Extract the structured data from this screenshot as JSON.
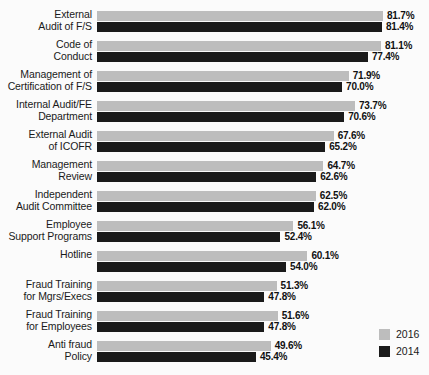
{
  "chart_data": {
    "type": "bar",
    "orientation": "horizontal",
    "title": "",
    "subtitle": "",
    "xlabel": "",
    "ylabel": "",
    "grid": false,
    "value_suffix": "%",
    "xlim": [
      0,
      81.7
    ],
    "legend_position": "bottom-right",
    "categories": [
      "External\nAudit of F/S",
      "Code of\nConduct",
      "Management of\nCertification of F/S",
      "Internal Audit/FE\nDepartment",
      "External Audit\nof ICOFR",
      "Management\nReview",
      "Independent\nAudit Committee",
      "Employee\nSupport Programs",
      "Hotline",
      "Fraud Training\nfor Mgrs/Execs",
      "Fraud Training\nfor Employees",
      "Anti fraud\nPolicy"
    ],
    "series": [
      {
        "name": "2016",
        "color": "#bdbdbd",
        "values": [
          81.7,
          81.1,
          71.9,
          73.7,
          67.6,
          64.7,
          62.5,
          56.1,
          60.1,
          51.3,
          51.6,
          49.6
        ],
        "labels": [
          "81.7%",
          "81.1%",
          "71.9%",
          "73.7%",
          "67.6%",
          "64.7%",
          "62.5%",
          "56.1%",
          "60.1%",
          "51.3%",
          "51.6%",
          "49.6%"
        ]
      },
      {
        "name": "2014",
        "color": "#1a1a1a",
        "values": [
          81.4,
          77.4,
          70.0,
          70.6,
          65.2,
          62.6,
          62.0,
          52.4,
          54.0,
          47.8,
          47.8,
          45.4
        ],
        "labels": [
          "81.4%",
          "77.4%",
          "70.0%",
          "70.6%",
          "65.2%",
          "62.6%",
          "62.0%",
          "52.4%",
          "54.0%",
          "47.8%",
          "47.8%",
          "45.4%"
        ]
      }
    ]
  },
  "legend": {
    "items": [
      {
        "label": "2016",
        "color": "#bdbdbd"
      },
      {
        "label": "2014",
        "color": "#1a1a1a"
      }
    ]
  },
  "colors": {
    "series_2016": "#bdbdbd",
    "series_2014": "#1a1a1a",
    "background": "#fbfbfb",
    "text": "#1a1a1a"
  }
}
